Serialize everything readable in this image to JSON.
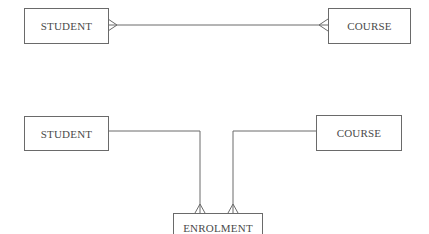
{
  "diagram": {
    "top": {
      "left_entity": "STUDENT",
      "right_entity": "COURSE",
      "relationship": "many-to-many"
    },
    "bottom": {
      "left_entity": "STUDENT",
      "right_entity": "COURSE",
      "link_entity": "ENROLMENT",
      "relationships": [
        "STUDENT one-to-many ENROLMENT",
        "COURSE one-to-many ENROLMENT"
      ]
    },
    "colors": {
      "line": "#6a6a6a",
      "text": "#4a4a4a",
      "background": "#ffffff"
    }
  }
}
